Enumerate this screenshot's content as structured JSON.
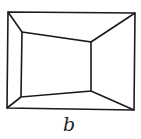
{
  "figure": {
    "label": "b",
    "stroke_color": "#1a1a1a",
    "background": "#ffffff",
    "outer_rect": [
      [
        8,
        12
      ],
      [
        135,
        13
      ],
      [
        134,
        110
      ],
      [
        7,
        108
      ]
    ],
    "inner_quad": [
      [
        22,
        32
      ],
      [
        91,
        42
      ],
      [
        91,
        91
      ],
      [
        21,
        97
      ]
    ],
    "connectors": [
      [
        [
          8,
          12
        ],
        [
          22,
          32
        ]
      ],
      [
        [
          135,
          13
        ],
        [
          91,
          42
        ]
      ],
      [
        [
          134,
          110
        ],
        [
          91,
          91
        ]
      ],
      [
        [
          7,
          108
        ],
        [
          21,
          97
        ]
      ]
    ]
  }
}
